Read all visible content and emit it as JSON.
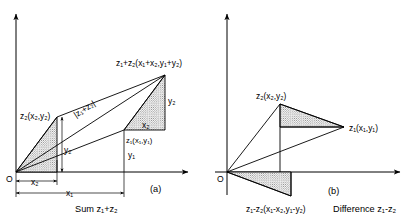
{
  "figure": {
    "title_absent": "",
    "background_color": "#ffffff",
    "line_color": "#000000",
    "hatch_color": "#555555",
    "panels": [
      {
        "id": "a",
        "panel_label": "(a)",
        "caption": "Sum z₁+z₂",
        "origin_label": "O",
        "labels": {
          "point_z2": "z₂(x₂,y₂)",
          "point_z1": "z₁(x₁,y₁)",
          "point_sum": "z₁+z₂(x₁+x₂,y₁+y₂)",
          "magnitude": "|z₁+z₂|",
          "dim_x2": "x₂",
          "dim_x1": "x₁",
          "dim_y1": "y₁",
          "dim_y2_left": "y₂",
          "dim_y2_right": "y₂",
          "dim_x2_inner": "x₂"
        }
      },
      {
        "id": "b",
        "panel_label": "(b)",
        "caption": "Difference z₁-z₂",
        "origin_label": "O",
        "labels": {
          "point_z2": "z₂(x₂,y₂)",
          "point_z1": "z₁(x₁,y₁)",
          "point_diff": "z₁-z₂(x₁-x₂,y₁-y₂)"
        }
      }
    ]
  }
}
